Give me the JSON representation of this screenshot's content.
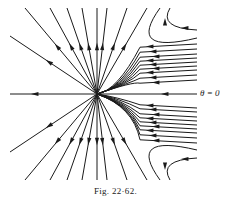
{
  "figure": {
    "caption": "Fig. 22·62.",
    "axis_label": "θ = 0",
    "center": [
      97,
      94
    ],
    "stroke": "#1a1a1a",
    "top_radial_ends": [
      [
        10,
        36
      ],
      [
        25,
        8
      ],
      [
        50,
        8
      ],
      [
        67,
        8
      ],
      [
        82,
        8
      ],
      [
        97,
        8
      ],
      [
        107,
        8
      ],
      [
        127,
        8
      ],
      [
        147,
        8
      ]
    ],
    "bottom_radial_ends": [
      [
        10,
        152
      ],
      [
        25,
        180
      ],
      [
        50,
        180
      ],
      [
        67,
        180
      ],
      [
        82,
        180
      ],
      [
        97,
        180
      ],
      [
        107,
        180
      ],
      [
        127,
        180
      ],
      [
        147,
        180
      ]
    ],
    "right_upper_ys": [
      44,
      49,
      54,
      58,
      62,
      66,
      70,
      75,
      80
    ],
    "right_lower_ys": [
      108,
      112,
      117,
      121,
      125,
      129,
      133,
      138,
      143
    ],
    "upper_hooks": [
      [
        160,
        8,
        126,
        55,
        197,
        38
      ],
      [
        170,
        8,
        158,
        28,
        197,
        30
      ]
    ],
    "lower_hooks": [
      [
        160,
        180,
        126,
        133,
        197,
        150
      ],
      [
        170,
        180,
        158,
        160,
        197,
        158
      ]
    ]
  }
}
